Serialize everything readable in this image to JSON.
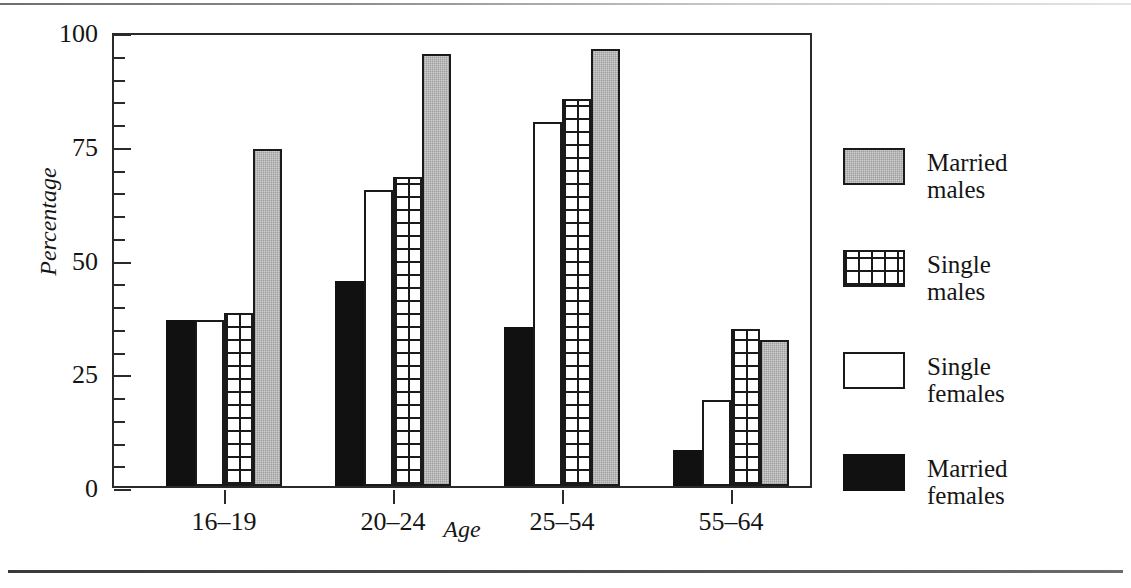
{
  "chart_data": {
    "type": "bar",
    "title": "",
    "xlabel": "Age",
    "ylabel": "Percentage",
    "categories": [
      "16–19",
      "20–24",
      "25–54",
      "55–64"
    ],
    "ylim": [
      0,
      100
    ],
    "yticks": [
      0,
      25,
      50,
      75,
      100
    ],
    "ytick_labels": [
      "0",
      "25",
      "50",
      "75",
      "100"
    ],
    "yminor_step": 5,
    "grid": false,
    "legend_position": "right",
    "series": [
      {
        "name": "Married females",
        "fill": "solid-black",
        "values": [
          36.5,
          45.0,
          35.0,
          8.0
        ]
      },
      {
        "name": "Single females",
        "fill": "diagonal",
        "values": [
          36.5,
          65.0,
          80.0,
          19.0
        ]
      },
      {
        "name": "Single males",
        "fill": "grid",
        "values": [
          38.0,
          68.0,
          85.0,
          34.5
        ]
      },
      {
        "name": "Married males",
        "fill": "gray-stipple",
        "values": [
          74.0,
          95.0,
          96.0,
          32.0
        ]
      }
    ],
    "bar_draw_order": [
      "Married females",
      "Single females",
      "Single males",
      "Married males"
    ]
  },
  "axes": {
    "y_title": "Percentage",
    "x_title": "Age",
    "y_labels": [
      "100",
      "75",
      "50",
      "25",
      "0"
    ],
    "x_labels": [
      "16–19",
      "20–24",
      "25–54",
      "55–64"
    ]
  },
  "legend": {
    "items": [
      {
        "line1": "Married",
        "line2": "males",
        "fill": "gray-stipple"
      },
      {
        "line1": "Single",
        "line2": "males",
        "fill": "grid"
      },
      {
        "line1": "Single",
        "line2": "females",
        "fill": "diagonal"
      },
      {
        "line1": "Married",
        "line2": "females",
        "fill": "solid-black"
      }
    ]
  },
  "colors": {
    "ink": "#1a1a1a",
    "gray_fill": "#cfcfcf",
    "black_fill": "#111111",
    "paper": "#ffffff"
  }
}
